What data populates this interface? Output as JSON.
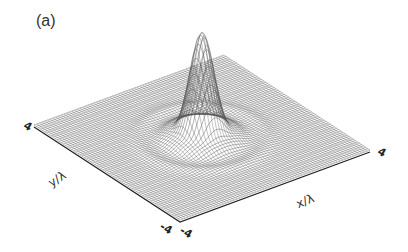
{
  "figure": {
    "panel_label": "(a)",
    "x_axis_label": "x/λ",
    "y_axis_label": "y/λ",
    "ticks": {
      "y_max": "4",
      "y_min": "-4",
      "x_min": "-4",
      "x_max": "4"
    },
    "line_color": "#555555",
    "edge_color": "#222222"
  },
  "chart_data": {
    "type": "surface-3d",
    "title": "(a)",
    "xlabel": "x/λ",
    "ylabel": "y/λ",
    "xlim": [
      -4,
      4
    ],
    "ylim": [
      -4,
      4
    ],
    "peak": {
      "x": 0,
      "y": 0,
      "relative_height": 1.0
    },
    "rings": [
      {
        "radius": 1.2,
        "relative_height": 0.04
      },
      {
        "radius": 2.2,
        "relative_height": 0.015
      }
    ],
    "grid": true
  }
}
